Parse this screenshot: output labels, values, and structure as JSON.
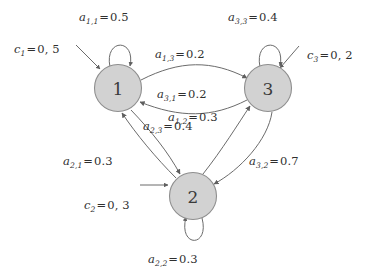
{
  "diagram": {
    "type": "state-transition-diagram",
    "title": "",
    "states": [
      {
        "id": "1",
        "label": "1",
        "cx": 118,
        "cy": 88
      },
      {
        "id": "2",
        "label": "2",
        "cx": 193,
        "cy": 196
      },
      {
        "id": "3",
        "label": "3",
        "cx": 268,
        "cy": 88
      }
    ],
    "node_fill": "#d2d2d2",
    "node_stroke": "#8e8e8e",
    "edge_color": "#6b6b6b",
    "initial_probabilities": [
      {
        "name": "c1",
        "var": "c",
        "sub": "1",
        "value": "0, 5",
        "text": "c_1 = 0, 5",
        "target": "1"
      },
      {
        "name": "c2",
        "var": "c",
        "sub": "2",
        "value": "0, 3",
        "text": "c_2 = 0, 3",
        "target": "2"
      },
      {
        "name": "c3",
        "var": "c",
        "sub": "3",
        "value": "0, 2",
        "text": "c_3 = 0, 2",
        "target": "3"
      }
    ],
    "transitions": [
      {
        "name": "a11",
        "var": "a",
        "sub": "1,1",
        "value": "0.5",
        "text": "a_{1,1} = 0.5",
        "from": "1",
        "to": "1",
        "kind": "self-loop"
      },
      {
        "name": "a22",
        "var": "a",
        "sub": "2,2",
        "value": "0.3",
        "text": "a_{2,2} = 0.3",
        "from": "2",
        "to": "2",
        "kind": "self-loop"
      },
      {
        "name": "a33",
        "var": "a",
        "sub": "3,3",
        "value": "0.4",
        "text": "a_{3,3} = 0.4",
        "from": "3",
        "to": "3",
        "kind": "self-loop"
      },
      {
        "name": "a13",
        "var": "a",
        "sub": "1,3",
        "value": "0.2",
        "text": "a_{1,3} = 0.2",
        "from": "1",
        "to": "3",
        "kind": "curve"
      },
      {
        "name": "a31",
        "var": "a",
        "sub": "3,1",
        "value": "0.2",
        "text": "a_{3,1} = 0.2",
        "from": "3",
        "to": "1",
        "kind": "curve"
      },
      {
        "name": "a12",
        "var": "a",
        "sub": "1,2",
        "value": "0.3",
        "text": "a_{1,2} = 0.3",
        "from": "1",
        "to": "2",
        "kind": "curve"
      },
      {
        "name": "a21",
        "var": "a",
        "sub": "2,1",
        "value": "0.3",
        "text": "a_{2,1} = 0.3",
        "from": "2",
        "to": "1",
        "kind": "curve"
      },
      {
        "name": "a23",
        "var": "a",
        "sub": "2,3",
        "value": "0.4",
        "text": "a_{2,3} = 0.4",
        "from": "2",
        "to": "3",
        "kind": "curve"
      },
      {
        "name": "a32",
        "var": "a",
        "sub": "3,2",
        "value": "0.7",
        "text": "a_{3,2} = 0.7",
        "from": "3",
        "to": "2",
        "kind": "curve"
      }
    ],
    "labels": {
      "a11": {
        "var": "a",
        "sub": "1,1",
        "eq": "=",
        "value": "0.5"
      },
      "a22": {
        "var": "a",
        "sub": "2,2",
        "eq": "=",
        "value": "0.3"
      },
      "a33": {
        "var": "a",
        "sub": "3,3",
        "eq": "=",
        "value": "0.4"
      },
      "a13": {
        "var": "a",
        "sub": "1,3",
        "eq": "=",
        "value": "0.2"
      },
      "a31": {
        "var": "a",
        "sub": "3,1",
        "eq": "=",
        "value": "0.2"
      },
      "a12": {
        "var": "a",
        "sub": "1,2",
        "eq": "=",
        "value": "0.3"
      },
      "a21": {
        "var": "a",
        "sub": "2,1",
        "eq": "=",
        "value": "0.3"
      },
      "a23": {
        "var": "a",
        "sub": "2,3",
        "eq": "=",
        "value": "0.4"
      },
      "a32": {
        "var": "a",
        "sub": "3,2",
        "eq": "=",
        "value": "0.7"
      },
      "c1": {
        "var": "c",
        "sub": "1",
        "eq": "=",
        "value": "0, 5"
      },
      "c2": {
        "var": "c",
        "sub": "2",
        "eq": "=",
        "value": "0, 3"
      },
      "c3": {
        "var": "c",
        "sub": "3",
        "eq": "=",
        "value": "0, 2"
      }
    }
  }
}
